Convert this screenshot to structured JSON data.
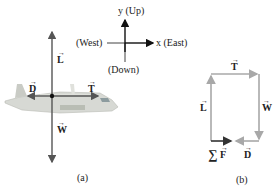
{
  "panel_a": {
    "caption": "(a)",
    "vectors": {
      "lift": "L",
      "weight": "W",
      "drag": "D",
      "thrust": "T"
    }
  },
  "axes": {
    "y_label": "y (Up)",
    "x_label": "x (East)",
    "west_label": "(West)",
    "down_label": "(Down)"
  },
  "panel_b": {
    "caption": "(b)",
    "vectors": {
      "thrust": "T",
      "weight": "W",
      "lift": "L",
      "drag": "D",
      "net_sum_symbol": "∑",
      "net_force": "F"
    }
  },
  "colors": {
    "force_vector": "#555555",
    "polygon_vector": "#a8a8a8",
    "net_vector": "#333333",
    "axis": "#111111"
  }
}
